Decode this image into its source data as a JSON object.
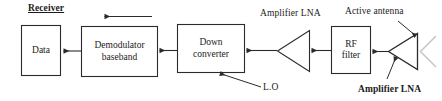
{
  "diagram": {
    "title": "Receiver",
    "blocks": [
      {
        "id": "data",
        "label_line1": "Data",
        "label_line2": ""
      },
      {
        "id": "demodulator",
        "label_line1": "Demodulator",
        "label_line2": "baseband"
      },
      {
        "id": "down-converter",
        "label_line1": "Down",
        "label_line2": "converter"
      },
      {
        "id": "rf-filter",
        "label_line1": "RF",
        "label_line2": "filter"
      }
    ],
    "annotations": {
      "amplifier_lna_top": "Amplifier LNA",
      "active_antenna": "Active antenna",
      "local_oscillator": "L.O",
      "amplifier_lna_bottom": "Amplifier LNA"
    },
    "colors": {
      "stroke": "#2b2b2b",
      "text": "#1a1a1a",
      "antenna": "#c8c8c8",
      "background": "#ffffff"
    }
  }
}
